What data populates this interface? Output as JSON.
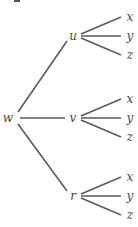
{
  "diagram": {
    "type": "tree",
    "root": {
      "label": "w",
      "children": [
        {
          "label": "u",
          "children": [
            {
              "label": "x"
            },
            {
              "label": "y"
            },
            {
              "label": "z"
            }
          ]
        },
        {
          "label": "v",
          "children": [
            {
              "label": "x"
            },
            {
              "label": "y"
            },
            {
              "label": "z"
            }
          ]
        },
        {
          "label": "r",
          "children": [
            {
              "label": "x"
            },
            {
              "label": "y"
            },
            {
              "label": "z"
            }
          ]
        }
      ]
    }
  }
}
